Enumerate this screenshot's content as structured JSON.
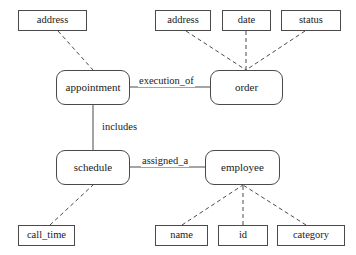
{
  "diagram": {
    "type": "entity-relationship-diagram",
    "background_color": "#ffffff",
    "stroke_color": "#4a4a4a",
    "text_color": "#1a1a1a",
    "entities": [
      {
        "id": "appointment",
        "label": "appointment",
        "x": 56,
        "y": 70,
        "w": 74,
        "h": 35
      },
      {
        "id": "order",
        "label": "order",
        "x": 210,
        "y": 70,
        "w": 73,
        "h": 35
      },
      {
        "id": "schedule",
        "label": "schedule",
        "x": 56,
        "y": 150,
        "w": 74,
        "h": 35
      },
      {
        "id": "employee",
        "label": "employee",
        "x": 205,
        "y": 150,
        "w": 75,
        "h": 35
      }
    ],
    "attributes": [
      {
        "id": "appointment_address",
        "label": "address",
        "owner": "appointment",
        "x": 18,
        "y": 10,
        "w": 69,
        "h": 21
      },
      {
        "id": "order_address",
        "label": "address",
        "owner": "order",
        "x": 155,
        "y": 10,
        "w": 56,
        "h": 21
      },
      {
        "id": "order_date",
        "label": "date",
        "owner": "order",
        "x": 222,
        "y": 10,
        "w": 49,
        "h": 21
      },
      {
        "id": "order_status",
        "label": "status",
        "owner": "order",
        "x": 281,
        "y": 10,
        "w": 60,
        "h": 21
      },
      {
        "id": "schedule_call_time",
        "label": "call_time",
        "owner": "schedule",
        "x": 18,
        "y": 225,
        "w": 57,
        "h": 21
      },
      {
        "id": "employee_name",
        "label": "name",
        "owner": "employee",
        "x": 155,
        "y": 225,
        "w": 53,
        "h": 21
      },
      {
        "id": "employee_id",
        "label": "id",
        "owner": "employee",
        "x": 218,
        "y": 225,
        "w": 50,
        "h": 21
      },
      {
        "id": "employee_category",
        "label": "category",
        "owner": "employee",
        "x": 277,
        "y": 225,
        "w": 68,
        "h": 21
      }
    ],
    "relationships": [
      {
        "id": "execution_of",
        "label": "execution_of",
        "from": "appointment",
        "to": "order",
        "label_x": 138,
        "label_y": 76
      },
      {
        "id": "includes",
        "label": "includes",
        "from": "appointment",
        "to": "schedule",
        "label_x": 101,
        "label_y": 122
      },
      {
        "id": "assigned_a",
        "label": "assigned_a",
        "from": "schedule",
        "to": "employee",
        "label_x": 141,
        "label_y": 156
      }
    ],
    "attribute_edges": [
      {
        "from": "appointment_address",
        "to": "appointment",
        "x1": 58,
        "y1": 31,
        "x2": 93,
        "y2": 70
      },
      {
        "from": "order_address",
        "to": "order",
        "x1": 186,
        "y1": 31,
        "x2": 246,
        "y2": 70
      },
      {
        "from": "order_date",
        "to": "order",
        "x1": 246,
        "y1": 31,
        "x2": 246,
        "y2": 70
      },
      {
        "from": "order_status",
        "to": "order",
        "x1": 305,
        "y1": 31,
        "x2": 246,
        "y2": 70
      },
      {
        "from": "schedule_call_time",
        "to": "schedule",
        "x1": 50,
        "y1": 225,
        "x2": 93,
        "y2": 185
      },
      {
        "from": "employee_name",
        "to": "employee",
        "x1": 182,
        "y1": 225,
        "x2": 243,
        "y2": 185
      },
      {
        "from": "employee_id",
        "to": "employee",
        "x1": 243,
        "y1": 225,
        "x2": 243,
        "y2": 185
      },
      {
        "from": "employee_category",
        "to": "employee",
        "x1": 306,
        "y1": 225,
        "x2": 243,
        "y2": 185
      }
    ],
    "relationship_edges": [
      {
        "from": "appointment",
        "to": "order",
        "x1": 130,
        "y1": 87,
        "x2": 210,
        "y2": 87
      },
      {
        "from": "appointment",
        "to": "schedule",
        "x1": 93,
        "y1": 105,
        "x2": 93,
        "y2": 150
      },
      {
        "from": "schedule",
        "to": "employee",
        "x1": 130,
        "y1": 167,
        "x2": 205,
        "y2": 167
      }
    ]
  }
}
